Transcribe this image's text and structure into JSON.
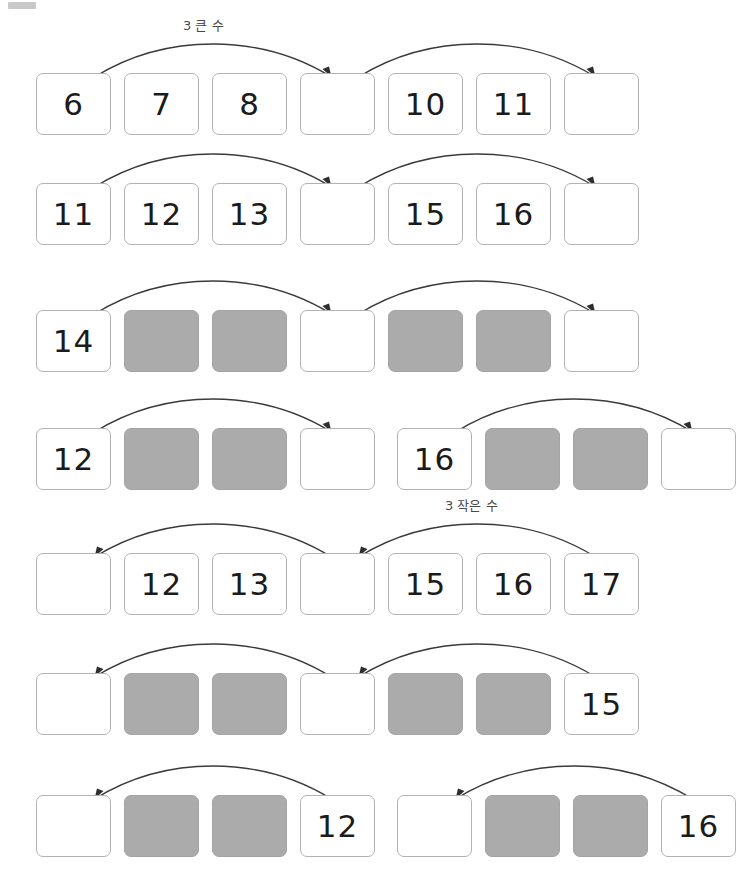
{
  "page": {
    "corner_mark": "gray-bar",
    "box_gray_hex": "#ababab",
    "box_border_hex": "#b2b2b2",
    "arrow_hex": "#3a3a3a"
  },
  "labels": {
    "greater": "3 큰 수",
    "smaller": "3 작은 수"
  },
  "rows": [
    {
      "id": "row-1",
      "direction": "right",
      "label": "3 큰 수",
      "label_left_px": 178,
      "split": false,
      "cells": [
        {
          "value": "6",
          "shaded": false
        },
        {
          "value": "7",
          "shaded": false
        },
        {
          "value": "8",
          "shaded": false
        },
        {
          "value": "",
          "shaded": false
        },
        {
          "value": "10",
          "shaded": false
        },
        {
          "value": "11",
          "shaded": false
        },
        {
          "value": "",
          "shaded": false
        }
      ]
    },
    {
      "id": "row-2",
      "direction": "right",
      "label": "",
      "split": false,
      "cells": [
        {
          "value": "11",
          "shaded": false
        },
        {
          "value": "12",
          "shaded": false
        },
        {
          "value": "13",
          "shaded": false
        },
        {
          "value": "",
          "shaded": false
        },
        {
          "value": "15",
          "shaded": false
        },
        {
          "value": "16",
          "shaded": false
        },
        {
          "value": "",
          "shaded": false
        }
      ]
    },
    {
      "id": "row-3",
      "direction": "right",
      "label": "",
      "split": false,
      "cells": [
        {
          "value": "14",
          "shaded": false
        },
        {
          "value": "",
          "shaded": true
        },
        {
          "value": "",
          "shaded": true
        },
        {
          "value": "",
          "shaded": false
        },
        {
          "value": "",
          "shaded": true
        },
        {
          "value": "",
          "shaded": true
        },
        {
          "value": "",
          "shaded": false
        }
      ]
    },
    {
      "id": "row-4",
      "direction": "right",
      "label": "",
      "split": true,
      "cells": [
        {
          "value": "12",
          "shaded": false
        },
        {
          "value": "",
          "shaded": true
        },
        {
          "value": "",
          "shaded": true
        },
        {
          "value": "",
          "shaded": false
        },
        {
          "value": "16",
          "shaded": false
        },
        {
          "value": "",
          "shaded": true
        },
        {
          "value": "",
          "shaded": true
        },
        {
          "value": "",
          "shaded": false
        }
      ]
    },
    {
      "id": "row-5",
      "direction": "left",
      "label": "3 작은 수",
      "label_left_px": 440,
      "split": false,
      "cells": [
        {
          "value": "",
          "shaded": false
        },
        {
          "value": "12",
          "shaded": false
        },
        {
          "value": "13",
          "shaded": false
        },
        {
          "value": "",
          "shaded": false
        },
        {
          "value": "15",
          "shaded": false
        },
        {
          "value": "16",
          "shaded": false
        },
        {
          "value": "17",
          "shaded": false
        }
      ]
    },
    {
      "id": "row-6",
      "direction": "left",
      "label": "",
      "split": false,
      "cells": [
        {
          "value": "",
          "shaded": false
        },
        {
          "value": "",
          "shaded": true
        },
        {
          "value": "",
          "shaded": true
        },
        {
          "value": "",
          "shaded": false
        },
        {
          "value": "",
          "shaded": true
        },
        {
          "value": "",
          "shaded": true
        },
        {
          "value": "15",
          "shaded": false
        }
      ]
    },
    {
      "id": "row-7",
      "direction": "left",
      "label": "",
      "split": true,
      "cells": [
        {
          "value": "",
          "shaded": false
        },
        {
          "value": "",
          "shaded": true
        },
        {
          "value": "",
          "shaded": true
        },
        {
          "value": "12",
          "shaded": false
        },
        {
          "value": "",
          "shaded": false
        },
        {
          "value": "",
          "shaded": true
        },
        {
          "value": "",
          "shaded": true
        },
        {
          "value": "16",
          "shaded": false
        }
      ]
    }
  ],
  "row_tops_px": [
    73,
    183,
    310,
    428,
    553,
    673,
    795
  ]
}
